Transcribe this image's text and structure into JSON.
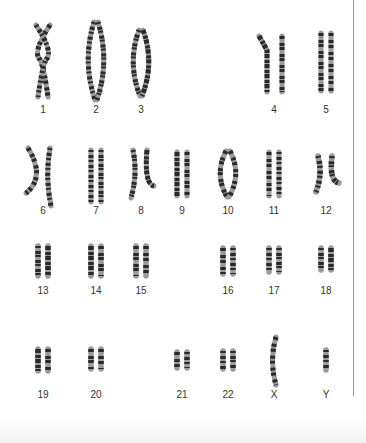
{
  "figure": {
    "type": "karyotype",
    "colors": {
      "band_dark": "#2a2a2a",
      "band_light": "#9a9a9a",
      "separator": "#9a9a9a",
      "label": "#333333"
    },
    "chromosomes": [
      {
        "id": "1",
        "label": "1",
        "x": 43,
        "y": 110,
        "top": 25,
        "len": 72,
        "bend": "x"
      },
      {
        "id": "2",
        "label": "2",
        "x": 96,
        "y": 110,
        "top": 22,
        "len": 78,
        "bend": "paren"
      },
      {
        "id": "3",
        "label": "3",
        "x": 141,
        "y": 110,
        "top": 30,
        "len": 66,
        "bend": "paren"
      },
      {
        "id": "4",
        "label": "4",
        "x": 274,
        "y": 110,
        "top": 36,
        "len": 56,
        "bend": "kink"
      },
      {
        "id": "5",
        "label": "5",
        "x": 326,
        "y": 110,
        "top": 33,
        "len": 58,
        "bend": "straight"
      },
      {
        "id": "6",
        "label": "6",
        "x": 43,
        "y": 211,
        "top": 148,
        "len": 58,
        "bend": "angle"
      },
      {
        "id": "7",
        "label": "7",
        "x": 96,
        "y": 211,
        "top": 150,
        "len": 52,
        "bend": "straight"
      },
      {
        "id": "8",
        "label": "8",
        "x": 141,
        "y": 211,
        "top": 150,
        "len": 48,
        "bend": "hook"
      },
      {
        "id": "9",
        "label": "9",
        "x": 182,
        "y": 211,
        "top": 152,
        "len": 44,
        "bend": "straight"
      },
      {
        "id": "10",
        "label": "10",
        "x": 228,
        "y": 211,
        "top": 151,
        "len": 46,
        "bend": "paren"
      },
      {
        "id": "11",
        "label": "11",
        "x": 274,
        "y": 211,
        "top": 152,
        "len": 44,
        "bend": "straight"
      },
      {
        "id": "12",
        "label": "12",
        "x": 326,
        "y": 211,
        "top": 156,
        "len": 36,
        "bend": "hook"
      },
      {
        "id": "13",
        "label": "13",
        "x": 43,
        "y": 291,
        "top": 246,
        "len": 30,
        "bend": "straight"
      },
      {
        "id": "14",
        "label": "14",
        "x": 96,
        "y": 291,
        "top": 246,
        "len": 30,
        "bend": "straight"
      },
      {
        "id": "15",
        "label": "15",
        "x": 141,
        "y": 291,
        "top": 246,
        "len": 30,
        "bend": "straight"
      },
      {
        "id": "16",
        "label": "16",
        "x": 228,
        "y": 291,
        "top": 248,
        "len": 26,
        "bend": "straight"
      },
      {
        "id": "17",
        "label": "17",
        "x": 274,
        "y": 291,
        "top": 248,
        "len": 24,
        "bend": "straight"
      },
      {
        "id": "18",
        "label": "18",
        "x": 326,
        "y": 291,
        "top": 248,
        "len": 22,
        "bend": "straight"
      },
      {
        "id": "19",
        "label": "19",
        "x": 43,
        "y": 395,
        "top": 349,
        "len": 22,
        "bend": "straight"
      },
      {
        "id": "20",
        "label": "20",
        "x": 96,
        "y": 395,
        "top": 349,
        "len": 20,
        "bend": "straight"
      },
      {
        "id": "21",
        "label": "21",
        "x": 182,
        "y": 395,
        "top": 352,
        "len": 16,
        "bend": "straight"
      },
      {
        "id": "22",
        "label": "22",
        "x": 228,
        "y": 395,
        "top": 351,
        "len": 18,
        "bend": "straight"
      },
      {
        "id": "X",
        "label": "X",
        "x": 274,
        "y": 395,
        "top": 337,
        "len": 48,
        "bend": "single-curve"
      },
      {
        "id": "Y",
        "label": "Y",
        "x": 326,
        "y": 395,
        "top": 350,
        "len": 20,
        "bend": "single"
      }
    ]
  }
}
